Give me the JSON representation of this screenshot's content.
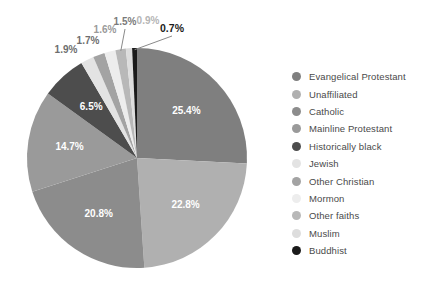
{
  "chart_data": {
    "type": "pie",
    "title": "",
    "subtitle": "",
    "xlabel": "",
    "ylabel": "",
    "legend_position": "right",
    "grid": false,
    "start_angle_deg": 0,
    "direction": "clockwise",
    "categories": [
      "Evangelical Protestant",
      "Unaffiliated",
      "Catholic",
      "Mainline Protestant",
      "Historically black",
      "Jewish",
      "Other Christian",
      "Mormon",
      "Other faiths",
      "Muslim",
      "Buddhist"
    ],
    "values": [
      25.4,
      22.8,
      20.8,
      14.7,
      6.5,
      1.9,
      1.7,
      1.6,
      1.5,
      0.9,
      0.7
    ],
    "value_labels": [
      "25.4%",
      "22.8%",
      "20.8%",
      "14.7%",
      "6.5%",
      "1.9%",
      "1.7%",
      "1.6%",
      "1.5%",
      "0.9%",
      "0.7%"
    ],
    "colors": [
      "#7f7f7f",
      "#b0b0b0",
      "#8c8c8c",
      "#9a9a9a",
      "#4d4d4d",
      "#e3e3e3",
      "#a3a3a3",
      "#ededed",
      "#b8b8b8",
      "#dddddd",
      "#1a1a1a"
    ],
    "label_colors": [
      "#ffffff",
      "#ffffff",
      "#ffffff",
      "#ffffff",
      "#ffffff",
      "#6e6e6e",
      "#6e6e6e",
      "#9a9a9a",
      "#7a7a7a",
      "#b5b5b5",
      "#1a1a1a"
    ],
    "background": "#ffffff"
  },
  "legend": {
    "items": [
      {
        "label": "Evangelical Protestant",
        "color": "#7f7f7f"
      },
      {
        "label": "Unaffiliated",
        "color": "#b0b0b0"
      },
      {
        "label": "Catholic",
        "color": "#8c8c8c"
      },
      {
        "label": "Mainline Protestant",
        "color": "#9a9a9a"
      },
      {
        "label": "Historically black",
        "color": "#4d4d4d"
      },
      {
        "label": "Jewish",
        "color": "#e3e3e3"
      },
      {
        "label": "Other Christian",
        "color": "#a3a3a3"
      },
      {
        "label": "Mormon",
        "color": "#ededed"
      },
      {
        "label": "Other faiths",
        "color": "#b8b8b8"
      },
      {
        "label": "Muslim",
        "color": "#dddddd"
      },
      {
        "label": "Buddhist",
        "color": "#1a1a1a"
      }
    ]
  }
}
